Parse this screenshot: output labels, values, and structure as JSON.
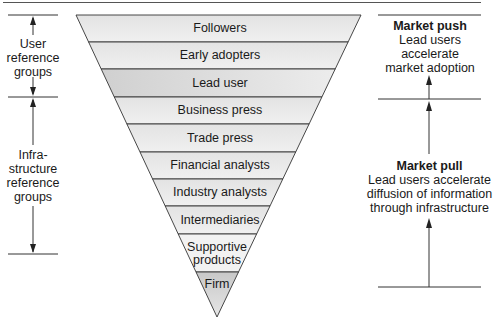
{
  "diagram": {
    "funnel_rows": [
      {
        "label": "Followers",
        "group": "user"
      },
      {
        "label": "Early adopters",
        "group": "user"
      },
      {
        "label": "Lead user",
        "group": "user",
        "highlight": true
      },
      {
        "label": "Business press",
        "group": "infrastructure"
      },
      {
        "label": "Trade press",
        "group": "infrastructure"
      },
      {
        "label": "Financial analysts",
        "group": "infrastructure"
      },
      {
        "label": "Industry analysts",
        "group": "infrastructure"
      },
      {
        "label": "Intermediaries",
        "group": "infrastructure"
      },
      {
        "label": "Supportive products",
        "group": "infrastructure"
      },
      {
        "label": "Firm",
        "group": "firm",
        "highlight": true
      }
    ],
    "left_groups": {
      "user": {
        "line1": "User",
        "line2": "reference",
        "line3": "groups"
      },
      "infrastructure": {
        "line1": "Infra-",
        "line2": "structure",
        "line3": "reference",
        "line4": "groups"
      }
    },
    "right_notes": {
      "push": {
        "title": "Market push",
        "line1": "Lead users",
        "line2": "accelerate",
        "line3": "market adoption"
      },
      "pull": {
        "title": "Market pull",
        "line1": "Lead users accelerate",
        "line2": "diffusion of information",
        "line3": "through infrastructure"
      }
    },
    "colors": {
      "row_fill": "#e9e9e9",
      "highlight_fill": "#d4d4d4",
      "line": "#333333"
    }
  }
}
